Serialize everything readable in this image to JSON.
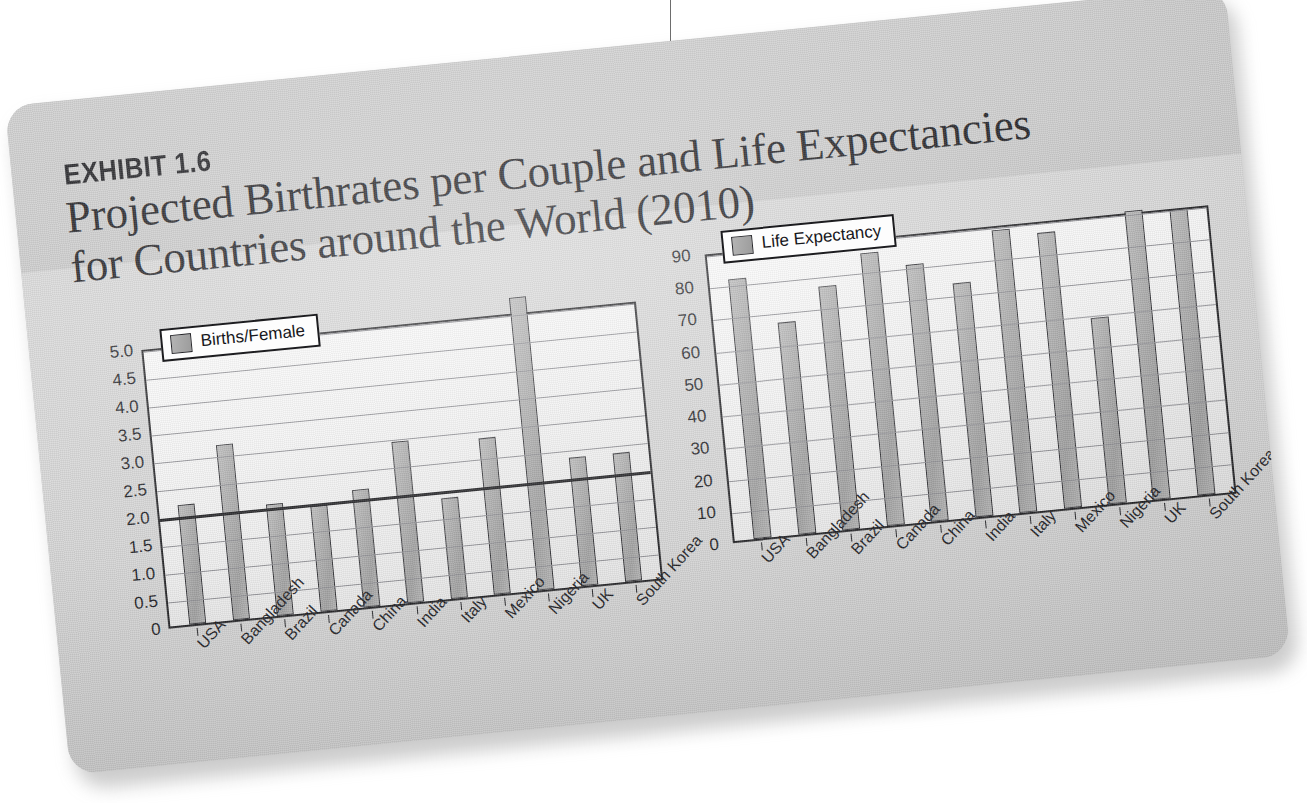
{
  "exhibit": {
    "label": "EXHIBIT 1.6",
    "title_line_1": "Projected Birthrates per Couple and Life Expectancies",
    "title_line_2": "for Countries around the World (2010)"
  },
  "colors": {
    "card_background": "#d2d2d2",
    "plot_background": "#f4f4f4",
    "bar_fill": "#a9a9a9",
    "bar_border": "#26262a",
    "gridline": "#8e8e93",
    "emphasis_line": "#17171a",
    "text": "#17171b",
    "page_background": "#ffffff"
  },
  "chart_data": [
    {
      "type": "bar",
      "title": "Projected Birthrates per Couple",
      "legend": [
        "Births/Female"
      ],
      "legend_position": "top-left-inside",
      "grid": true,
      "xlabel": "",
      "ylabel": "",
      "ylim": [
        0,
        5.0
      ],
      "yticks": [
        "0",
        "0.5",
        "1.0",
        "1.5",
        "2.0",
        "2.5",
        "3.0",
        "3.5",
        "4.0",
        "4.5",
        "5.0"
      ],
      "categories": [
        "USA",
        "Bangladesh",
        "Brazil",
        "Canada",
        "China",
        "India",
        "Italy",
        "Mexico",
        "Nigeria",
        "UK",
        "South Korea"
      ],
      "values": [
        2.15,
        3.15,
        2.0,
        1.9,
        2.1,
        2.9,
        1.8,
        2.8,
        5.25,
        2.3,
        2.3
      ],
      "series": [
        {
          "name": "Births/Female",
          "values": [
            2.15,
            3.15,
            2.0,
            1.9,
            2.1,
            2.9,
            1.8,
            2.8,
            5.25,
            2.3,
            2.3
          ]
        }
      ],
      "reference_line": 2.0
    },
    {
      "type": "bar",
      "title": "Life Expectancies",
      "legend": [
        "Life Expectancy"
      ],
      "legend_position": "top-left-inside",
      "grid": true,
      "xlabel": "",
      "ylabel": "",
      "ylim": [
        0,
        90
      ],
      "yticks": [
        "0",
        "10",
        "20",
        "30",
        "40",
        "50",
        "60",
        "70",
        "80",
        "90"
      ],
      "categories": [
        "USA",
        "Bangladesh",
        "Brazil",
        "Canada",
        "China",
        "India",
        "Italy",
        "Mexico",
        "Nigeria",
        "UK",
        "South Korea"
      ],
      "values": [
        81,
        66,
        76,
        85,
        80,
        73,
        88,
        86,
        58,
        90,
        89
      ],
      "series": [
        {
          "name": "Life Expectancy",
          "values": [
            81,
            66,
            76,
            85,
            80,
            73,
            88,
            86,
            58,
            90,
            89
          ]
        }
      ]
    }
  ]
}
